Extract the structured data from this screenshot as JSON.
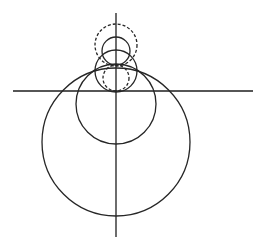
{
  "diagram": {
    "type": "geometric-circles",
    "background": "#ffffff",
    "stroke_color": "#262626",
    "axes": {
      "horizontal": {
        "x1": 13,
        "y1": 91,
        "x2": 253,
        "y2": 91
      },
      "vertical": {
        "x1": 116,
        "y1": 13,
        "x2": 116,
        "y2": 237
      }
    },
    "circles": [
      {
        "id": "large-solid",
        "cx": 116,
        "cy": 142,
        "r": 74,
        "style": "solid"
      },
      {
        "id": "medium-solid",
        "cx": 116,
        "cy": 104,
        "r": 40,
        "style": "solid"
      },
      {
        "id": "small-solid-lower",
        "cx": 116,
        "cy": 71,
        "r": 21,
        "style": "solid"
      },
      {
        "id": "small-solid-upper",
        "cx": 116,
        "cy": 51,
        "r": 14,
        "style": "solid"
      },
      {
        "id": "large-dashed-upper",
        "cx": 116,
        "cy": 45,
        "r": 21,
        "style": "dashed"
      },
      {
        "id": "small-dashed-lower",
        "cx": 116,
        "cy": 78,
        "r": 13,
        "style": "dashed"
      }
    ]
  }
}
